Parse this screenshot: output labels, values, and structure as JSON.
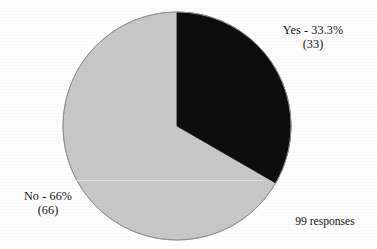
{
  "chart_data": {
    "type": "pie",
    "title": "",
    "subtitle": "",
    "labels": [
      "Yes",
      "No"
    ],
    "values": [
      33,
      66
    ],
    "percentages": [
      33.3,
      66
    ],
    "total": 99,
    "total_label": "99 responses",
    "legend": "none",
    "grid": false,
    "start_angle_deg": 0,
    "direction": "clockwise",
    "slices": [
      {
        "name": "Yes",
        "value": 33,
        "percent": 33.3,
        "color": "#0d0d0d",
        "label_line1": "Yes - 33.3%",
        "label_line2": "(33)",
        "sweep_deg": 120
      },
      {
        "name": "No",
        "value": 66,
        "percent": 66,
        "color": "#c8c8c8",
        "label_line1": "No - 66%",
        "label_line2": "(66)",
        "sweep_deg": 240
      }
    ],
    "xlabel": "",
    "ylabel": ""
  },
  "labels": {
    "yes": {
      "line1": "Yes - 33.3%",
      "line2": "(33)"
    },
    "no": {
      "line1": "No - 66%",
      "line2": "(66)"
    }
  },
  "footer": {
    "responses": "99 responses"
  },
  "colors": {
    "slice_yes": "#0d0d0d",
    "slice_no": "#c8c8c8",
    "outline": "#8a8a8a",
    "background": "#fdfdfd",
    "text": "#121212"
  }
}
